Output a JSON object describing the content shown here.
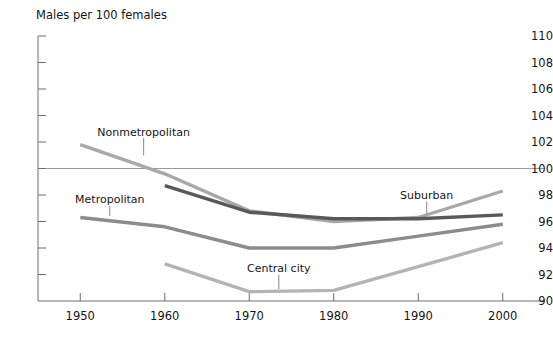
{
  "chart_data": {
    "type": "line",
    "title": "",
    "ylabel": "Males per 100 females",
    "xlabel": "",
    "ylim": [
      90,
      110
    ],
    "xlim": [
      1945,
      2005
    ],
    "yticks": [
      90,
      92,
      94,
      96,
      98,
      100,
      102,
      104,
      106,
      108,
      110
    ],
    "ytick_labels": [
      "90",
      "92",
      "94",
      "96",
      "98",
      "100",
      "102",
      "104",
      "106",
      "108",
      "110"
    ],
    "x": [
      1950,
      1960,
      1970,
      1980,
      1990,
      2000
    ],
    "xtick_labels": [
      "1950",
      "1960",
      "1970",
      "1980",
      "1990",
      "2000"
    ],
    "gridlines": {
      "horizontal_at": [
        100
      ],
      "vertical": false
    },
    "legend_position": "inline-annotations",
    "series": [
      {
        "name": "Nonmetropolitan",
        "color": "#a8a8a8",
        "x": [
          1950,
          1960,
          1970,
          1980,
          1990,
          2000
        ],
        "values": [
          101.8,
          99.6,
          96.8,
          96.0,
          96.3,
          98.3
        ],
        "label": "Nonmetropolitan",
        "label_x": 1957.5,
        "label_y": 102.4,
        "leader_to_y": 101.0
      },
      {
        "name": "Metropolitan",
        "color": "#8c8c8c",
        "x": [
          1950,
          1960,
          1970,
          1980,
          1990,
          2000
        ],
        "values": [
          96.3,
          95.6,
          94.0,
          94.0,
          94.9,
          95.8
        ],
        "label": "Metropolitan",
        "label_x": 1953.5,
        "label_y": 97.3,
        "leader_to_y": 96.4
      },
      {
        "name": "Suburban",
        "color": "#58595b",
        "x": [
          1960,
          1970,
          1980,
          1990,
          2000
        ],
        "values": [
          98.7,
          96.7,
          96.2,
          96.2,
          96.5
        ],
        "label": "Suburban",
        "label_x": 1991.0,
        "label_y": 97.6,
        "leader_to_y": 96.5
      },
      {
        "name": "Central city",
        "color": "#b4b4b4",
        "x": [
          1960,
          1970,
          1980,
          1990,
          2000
        ],
        "values": [
          92.8,
          90.7,
          90.8,
          92.6,
          94.4
        ],
        "label": "Central city",
        "label_x": 1973.5,
        "label_y": 92.1,
        "leader_to_y": 90.9
      }
    ]
  },
  "colors": {
    "axis": "#6e6e6e",
    "gridline": "#9a9a9a",
    "text": "#151515",
    "background": "#ffffff"
  }
}
